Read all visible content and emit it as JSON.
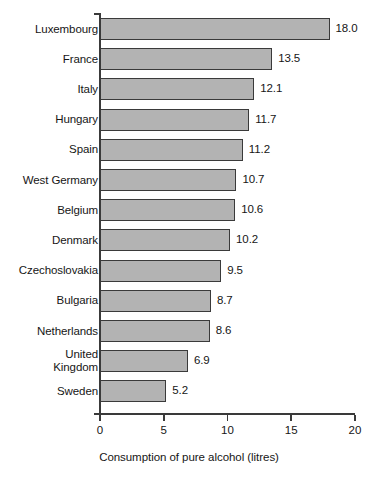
{
  "chart_data": {
    "type": "bar",
    "orientation": "horizontal",
    "title": "",
    "subtitle": "",
    "xlabel": "Consumption of pure alcohol (litres)",
    "ylabel": "",
    "xlim": [
      0,
      20
    ],
    "xticks": [
      0,
      5,
      10,
      15,
      20
    ],
    "xtick_labels": [
      "0",
      "5",
      "10",
      "15",
      "20"
    ],
    "grid": false,
    "legend": null,
    "categories": [
      "Luxembourg",
      "France",
      "Italy",
      "Hungary",
      "Spain",
      "West Germany",
      "Belgium",
      "Denmark",
      "Czechoslovakia",
      "Bulgaria",
      "Netherlands",
      "United\nKingdom",
      "Sweden"
    ],
    "values": [
      18.0,
      13.5,
      12.1,
      11.7,
      11.2,
      10.7,
      10.6,
      10.2,
      9.5,
      8.7,
      8.6,
      6.9,
      5.2
    ],
    "value_labels": [
      "18.0",
      "13.5",
      "12.1",
      "11.7",
      "11.2",
      "10.7",
      "10.6",
      "10.2",
      "9.5",
      "8.7",
      "8.6",
      "6.9",
      "5.2"
    ],
    "bar_color": "#b3b3b3",
    "bar_edge_color": "#3a3a3a",
    "axis_color": "#3a3a3a",
    "background_color": "#ffffff"
  }
}
